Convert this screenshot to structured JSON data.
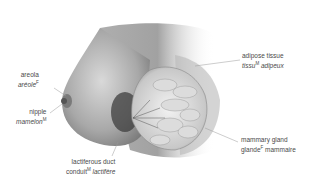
{
  "diagram": {
    "labels": [
      {
        "id": "areola",
        "en": "areola",
        "fr": "aréole",
        "gender": "F"
      },
      {
        "id": "nipple",
        "en": "nipple",
        "fr": "mamelon",
        "gender": "M"
      },
      {
        "id": "lactiferous-duct",
        "en": "lactiferous duct",
        "fr_a": "conduit",
        "fr_b": "lactifère",
        "gender": "M"
      },
      {
        "id": "adipose-tissue",
        "en": "adipose tissue",
        "fr_a": "tissu",
        "fr_b": "adipeux",
        "gender": "M"
      },
      {
        "id": "mammary-gland",
        "en": "mammary gland",
        "fr_a": "glande",
        "fr_b": "mammaire",
        "gender": "F"
      }
    ]
  }
}
